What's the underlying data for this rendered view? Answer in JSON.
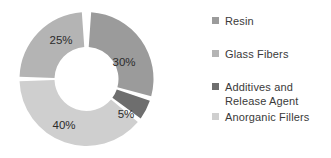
{
  "chart_data": {
    "type": "pie",
    "variant": "donut",
    "title": "",
    "xlabel": "",
    "ylabel": "",
    "legend_position": "right",
    "grid": false,
    "units": "percent",
    "total": 100,
    "categories": [
      "Resin",
      "Glass Fibers",
      "Additives and Release Agent",
      "Anorganic Fillers"
    ],
    "values": [
      30,
      25,
      5,
      40
    ],
    "labels": [
      "30%",
      "25%",
      "5%",
      "40%"
    ],
    "colors": [
      "#9b9b9b",
      "#b4b4b4",
      "#6e6e6e",
      "#cfcfcf"
    ],
    "slices": [
      {
        "category": "Resin",
        "value": 30,
        "label": "30%",
        "color": "#9b9b9b",
        "start_deg": 4,
        "end_deg": 105,
        "label_x": 110,
        "label_y": 58
      },
      {
        "category": "Additives and Release Agent",
        "value": 5,
        "label": "5%",
        "color": "#6e6e6e",
        "start_deg": 109,
        "end_deg": 126,
        "label_x": 112,
        "label_y": 110
      },
      {
        "category": "Anorganic Fillers",
        "value": 40,
        "label": "40%",
        "color": "#cfcfcf",
        "start_deg": 130,
        "end_deg": 268,
        "label_x": 50,
        "label_y": 121
      },
      {
        "category": "Glass Fibers",
        "value": 25,
        "label": "25%",
        "color": "#b4b4b4",
        "start_deg": 272,
        "end_deg": 356,
        "label_x": 47,
        "label_y": 36
      }
    ]
  },
  "legend": {
    "items": [
      {
        "label": "Resin",
        "color": "#9b9b9b"
      },
      {
        "label": "Glass Fibers",
        "color": "#b4b4b4"
      },
      {
        "label": "Additives and Release Agent",
        "color": "#6e6e6e"
      },
      {
        "label": "Anorganic Fillers",
        "color": "#cfcfcf"
      }
    ]
  }
}
